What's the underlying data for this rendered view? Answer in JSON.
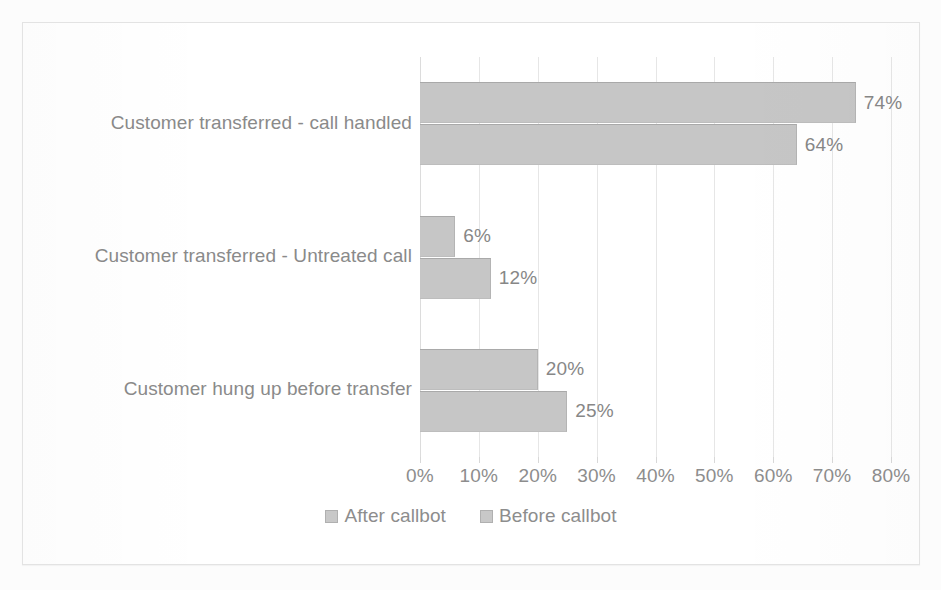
{
  "chart_data": {
    "type": "bar",
    "orientation": "horizontal",
    "title": "",
    "xlabel": "",
    "ylabel": "",
    "categories": [
      "Customer transferred - call handled",
      "Customer transferred - Untreated call",
      "Customer hung up before transfer"
    ],
    "series": [
      {
        "name": "After callbot",
        "values": [
          74,
          6,
          20
        ],
        "color": "#c6c6c6"
      },
      {
        "name": "Before callbot",
        "values": [
          64,
          12,
          25
        ],
        "color": "#c6c6c6"
      }
    ],
    "value_labels": [
      [
        "74%",
        "64%"
      ],
      [
        "6%",
        "12%"
      ],
      [
        "20%",
        "25%"
      ]
    ],
    "xlim": [
      0,
      80
    ],
    "xticks": [
      0,
      10,
      20,
      30,
      40,
      50,
      60,
      70,
      80
    ],
    "xtick_labels": [
      "0%",
      "10%",
      "20%",
      "30%",
      "40%",
      "50%",
      "60%",
      "70%",
      "80%"
    ],
    "grid": true,
    "grid_axis": "x",
    "legend_position": "bottom",
    "value_suffix": "%"
  },
  "legend": {
    "items": [
      {
        "label": "After callbot",
        "swatch_color": "#c8c8c8"
      },
      {
        "label": "Before callbot",
        "swatch_color": "#c8c8c8"
      }
    ]
  },
  "colors": {
    "bar_fill": "#c6c6c6",
    "bar_edge": "#a9a9a9",
    "gridline": "#e6e6e6",
    "text": "#8a8a8a",
    "panel_border": "#e3e3e3",
    "background": "#ffffff"
  }
}
